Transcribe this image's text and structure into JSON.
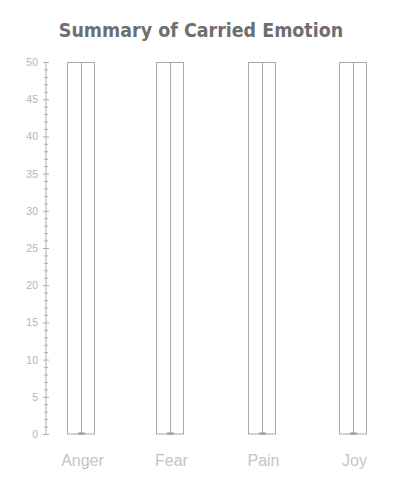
{
  "chart_data": {
    "type": "bar",
    "title": "Summary of Carried Emotion",
    "xlabel": "",
    "ylabel": "",
    "categories": [
      "Anger",
      "Fear",
      "Pain",
      "Joy"
    ],
    "values": [
      50,
      50,
      50,
      50
    ],
    "ylim": [
      0,
      50
    ],
    "yticks": [
      0,
      5,
      10,
      15,
      20,
      25,
      30,
      35,
      40,
      45,
      50
    ],
    "y_minor_tick_step": 1,
    "grid": false,
    "legend": null,
    "style": {
      "bar_fill": "#ffffff",
      "bar_edge": "#a8a8a8",
      "axis_color": "#b0b0b0",
      "title_color": "#6e6e6e",
      "label_color": "#c4c4c4"
    }
  }
}
